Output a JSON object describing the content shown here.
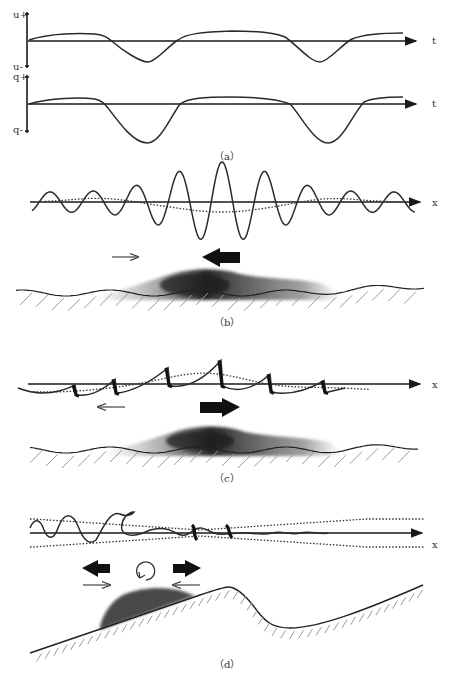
{
  "figure": {
    "panels": [
      {
        "id": "a",
        "caption": "（a）",
        "subplots": [
          {
            "name": "velocity",
            "y_top_label": "u+",
            "y_bottom_label": "u-",
            "x_label": "t",
            "description": "Near-bed velocity time series: broad positive crests with sharper troughs"
          },
          {
            "name": "sediment-flux",
            "y_top_label": "q+",
            "y_bottom_label": "q-",
            "x_label": "t",
            "description": "Sediment transport rate time series with deep troughs"
          }
        ]
      },
      {
        "id": "b",
        "caption": "（b）",
        "x_label": "x",
        "description": "Wave group with dotted bound long wave (set-down under group); small onshore arrow, large offshore arrow above sediment cloud on rippled bed"
      },
      {
        "id": "c",
        "caption": "（c）",
        "x_label": "x",
        "description": "Skewed/asymmetric wave forms with dotted long wave; small offshore arrow, large onshore arrow above sediment cloud on rippled bed"
      },
      {
        "id": "d",
        "caption": "（d）",
        "x_label": "x",
        "description": "Breaking waves with dotted group envelope; large arrows diverging, small arrows converging, circulation symbol above sediment bar on sloping beach with trough"
      }
    ]
  }
}
